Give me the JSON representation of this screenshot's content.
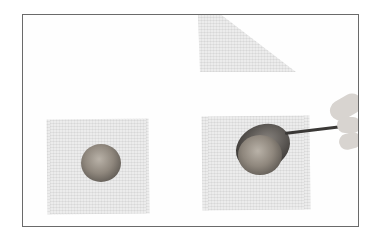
{
  "image": {
    "description": "Photo of wonton wrappers on white background: a folded triangular wrapper at top, a square wrapper with a mound of filling at left, and a square wrapper receiving filling from a spoon held by a hand at right",
    "colors": {
      "background": "#fefefe",
      "border": "#6a6a6a",
      "wrapper": "#ececec",
      "filling": "#8f877d",
      "spoon": "#3d3a37"
    }
  }
}
